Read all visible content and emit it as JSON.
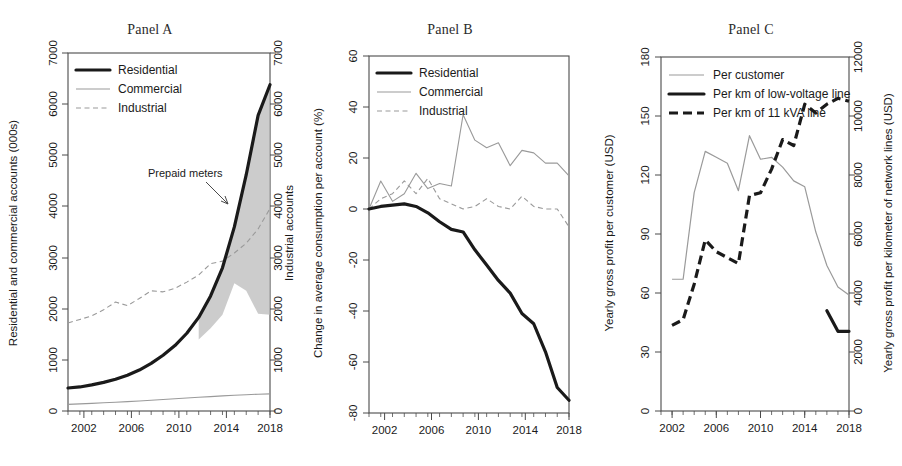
{
  "figure": {
    "width": 902,
    "height": 466,
    "background": "#ffffff"
  },
  "panels": [
    {
      "id": "A",
      "title": "Panel A"
    },
    {
      "id": "B",
      "title": "Panel B"
    },
    {
      "id": "C",
      "title": "Panel C"
    }
  ],
  "colors": {
    "heavy_line": "#1a1a1a",
    "light_line": "#9a9a9a",
    "shade": "#b8b8b8",
    "axis": "#4a4a4a"
  },
  "chart_data": [
    {
      "type": "line",
      "panel": "A",
      "title": "Panel A",
      "xlabel": "",
      "ylabel": "Residential and commercial accounts (000s)",
      "y2label": "Industrial accounts",
      "xlim": [
        2001,
        2018
      ],
      "ylim": [
        0,
        7000
      ],
      "y2lim": [
        0,
        7000
      ],
      "xticks": [
        2002,
        2006,
        2010,
        2014,
        2018
      ],
      "xticks_minor": [
        2001,
        2002,
        2003,
        2004,
        2005,
        2006,
        2007,
        2008,
        2009,
        2010,
        2011,
        2012,
        2013,
        2014,
        2015,
        2016,
        2017,
        2018
      ],
      "yticks": [
        0,
        1000,
        2000,
        3000,
        4000,
        5000,
        6000,
        7000
      ],
      "y2ticks": [
        0,
        1000,
        2000,
        3000,
        4000,
        5000,
        6000,
        7000
      ],
      "grid": false,
      "legend_position": "top-left",
      "legend": [
        "Residential",
        "Commercial",
        "Industrial"
      ],
      "annotations": [
        {
          "text": "Prepaid meters",
          "x": 2013.0,
          "y": 4600
        }
      ],
      "x": [
        2001,
        2002,
        2003,
        2004,
        2005,
        2006,
        2007,
        2008,
        2009,
        2010,
        2011,
        2012,
        2013,
        2014,
        2015,
        2016,
        2017,
        2018
      ],
      "series": [
        {
          "name": "Residential",
          "style": "solid-heavy",
          "values": [
            450,
            470,
            510,
            560,
            620,
            700,
            800,
            930,
            1090,
            1280,
            1520,
            1830,
            2250,
            2800,
            3600,
            4620,
            5780,
            6380
          ]
        },
        {
          "name": "Commercial",
          "style": "solid-light",
          "values": [
            130,
            140,
            150,
            160,
            172,
            184,
            196,
            210,
            225,
            240,
            255,
            268,
            282,
            295,
            308,
            318,
            328,
            335
          ]
        },
        {
          "name": "Industrial",
          "style": "dashed-light",
          "values": [
            1720,
            1790,
            1860,
            1980,
            2130,
            2060,
            2200,
            2350,
            2330,
            2400,
            2520,
            2660,
            2880,
            2930,
            3090,
            3280,
            3560,
            3960
          ]
        }
      ],
      "shaded_band": {
        "label": "Prepaid meters",
        "upper_series": "Residential",
        "lower_values": [
          null,
          null,
          null,
          null,
          null,
          null,
          null,
          null,
          null,
          null,
          null,
          1400,
          1620,
          1880,
          2500,
          2350,
          1900,
          1880
        ],
        "start_year": 2011,
        "end_year": 2018
      }
    },
    {
      "type": "line",
      "panel": "B",
      "title": "Panel B",
      "xlabel": "",
      "ylabel": "Change in average consumption per account (%)",
      "xlim": [
        2001,
        2018
      ],
      "ylim": [
        -80,
        60
      ],
      "xticks": [
        2002,
        2006,
        2010,
        2014,
        2018
      ],
      "xticks_minor": [
        2001,
        2002,
        2003,
        2004,
        2005,
        2006,
        2007,
        2008,
        2009,
        2010,
        2011,
        2012,
        2013,
        2014,
        2015,
        2016,
        2017,
        2018
      ],
      "yticks": [
        -80,
        -60,
        -40,
        -20,
        0,
        20,
        40,
        60
      ],
      "grid": false,
      "legend_position": "top-left",
      "legend": [
        "Residential",
        "Commercial",
        "Industrial"
      ],
      "x": [
        2001,
        2002,
        2003,
        2004,
        2005,
        2006,
        2007,
        2008,
        2009,
        2010,
        2011,
        2012,
        2013,
        2014,
        2015,
        2016,
        2017,
        2018
      ],
      "series": [
        {
          "name": "Residential",
          "style": "solid-heavy",
          "values": [
            0,
            1,
            1.5,
            2,
            1,
            -1.5,
            -5,
            -8,
            -9,
            -16,
            -22,
            -28,
            -33,
            -41,
            -45,
            -56,
            -70,
            -75
          ]
        },
        {
          "name": "Commercial",
          "style": "solid-light",
          "values": [
            0,
            11,
            3,
            6,
            14,
            8,
            10,
            9,
            37,
            27,
            24,
            26,
            17,
            23,
            22,
            18,
            18,
            13
          ]
        },
        {
          "name": "Industrial",
          "style": "dashed-light",
          "values": [
            0,
            4,
            6,
            11,
            6,
            12,
            4,
            2,
            0,
            1,
            4,
            1,
            0,
            5,
            1,
            0,
            0,
            -7
          ]
        }
      ]
    },
    {
      "type": "line",
      "panel": "C",
      "title": "Panel C",
      "xlabel": "",
      "ylabel": "Yearly gross profit per customer (USD)",
      "y2label": "Yearly gross profit per kilometer of network lines (USD)",
      "xlim": [
        2001,
        2018
      ],
      "ylim": [
        0,
        180
      ],
      "y2lim": [
        0,
        12000
      ],
      "xticks": [
        2002,
        2006,
        2010,
        2014,
        2018
      ],
      "xticks_minor": [
        2001,
        2002,
        2003,
        2004,
        2005,
        2006,
        2007,
        2008,
        2009,
        2010,
        2011,
        2012,
        2013,
        2014,
        2015,
        2016,
        2017,
        2018
      ],
      "yticks": [
        0,
        30,
        60,
        90,
        120,
        150,
        180
      ],
      "y2ticks": [
        0,
        2000,
        4000,
        6000,
        8000,
        10000,
        12000
      ],
      "grid": false,
      "legend_position": "top-left",
      "legend": [
        "Per customer",
        "Per km of low-voltage line",
        "Per km of 11 kVA line"
      ],
      "x": [
        2002,
        2003,
        2004,
        2005,
        2006,
        2007,
        2008,
        2009,
        2010,
        2011,
        2012,
        2013,
        2014,
        2015,
        2016,
        2017,
        2018
      ],
      "series": [
        {
          "name": "Per customer",
          "axis": "left",
          "style": "solid-light",
          "values": [
            67,
            67,
            111,
            132,
            129,
            126,
            112,
            140,
            128,
            129,
            124,
            117,
            114,
            91,
            74,
            63,
            59
          ]
        },
        {
          "name": "Per km of low-voltage line",
          "axis": "right",
          "style": "solid-heavy",
          "values": [
            2900,
            3100,
            4300,
            5800,
            5400,
            5200,
            5000,
            7300,
            7400,
            8200,
            9200,
            9000,
            10400,
            10000,
            3400,
            2700,
            2700
          ],
          "visible_segments": [
            [
              2016,
              2018
            ]
          ]
        },
        {
          "name": "Per km of 11 kVA line",
          "axis": "right",
          "style": "dashed-heavy",
          "values": [
            2900,
            3100,
            4300,
            5800,
            5400,
            5200,
            5000,
            7300,
            7400,
            8200,
            9200,
            9000,
            10400,
            10100,
            10400,
            10600,
            10500
          ]
        }
      ]
    }
  ]
}
